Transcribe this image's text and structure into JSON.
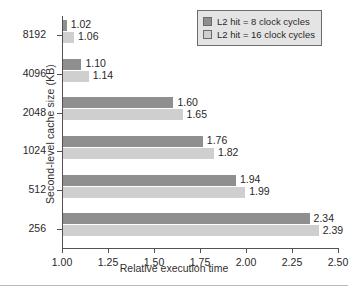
{
  "chart_data": {
    "type": "bar",
    "orientation": "horizontal",
    "title": "",
    "xlabel": "Relative execution time",
    "ylabel": "Second-level cache size (KB)",
    "categories": [
      "8192",
      "4096",
      "2048",
      "1024",
      "512",
      "256"
    ],
    "xlim": [
      1.0,
      2.5
    ],
    "xticks": [
      "1.00",
      "1.25",
      "1.50",
      "1.75",
      "2.00",
      "2.25",
      "2.50"
    ],
    "xtick_values": [
      1.0,
      1.25,
      1.5,
      1.75,
      2.0,
      2.25,
      2.5
    ],
    "bar_base": 1.0,
    "grid": false,
    "legend_position": "top-right",
    "series": [
      {
        "name": "L2 hit = 8 clock cycles",
        "color": "#8f8f8f",
        "values": [
          1.02,
          1.1,
          1.6,
          1.76,
          1.94,
          2.34
        ],
        "labels": [
          "1.02",
          "1.10",
          "1.60",
          "1.76",
          "1.94",
          "2.34"
        ]
      },
      {
        "name": "L2 hit = 16 clock cycles",
        "color": "#cfcfcf",
        "values": [
          1.06,
          1.14,
          1.65,
          1.82,
          1.99,
          2.39
        ],
        "labels": [
          "1.06",
          "1.14",
          "1.65",
          "1.82",
          "1.99",
          "2.39"
        ]
      }
    ]
  },
  "legend": {
    "entries": [
      {
        "label": "L2 hit = 8 clock cycles",
        "color": "#8f8f8f"
      },
      {
        "label": "L2 hit = 16 clock cycles",
        "color": "#cfcfcf"
      }
    ]
  },
  "axes": {
    "x_title": "Relative execution time",
    "y_title": "Second-level cache size (KB)"
  }
}
